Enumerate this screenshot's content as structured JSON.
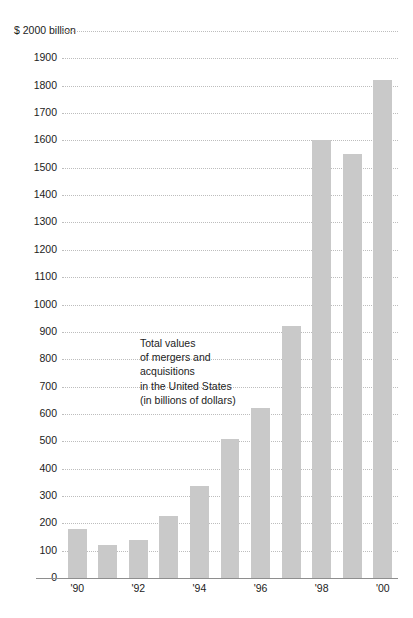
{
  "chart_data": {
    "type": "bar",
    "title": "",
    "subtitle": "",
    "xlabel": "",
    "ylabel": "",
    "y_axis_top_label": "$ 2000 billion",
    "categories": [
      "'90",
      "'91",
      "'92",
      "'93",
      "'94",
      "'95",
      "'96",
      "'97",
      "'98",
      "'99",
      "'00"
    ],
    "values": [
      180,
      120,
      140,
      225,
      335,
      510,
      620,
      920,
      1600,
      1550,
      1820
    ],
    "ylim": [
      0,
      2000
    ],
    "y_tick_step": 100,
    "y_ticks": [
      0,
      100,
      200,
      300,
      400,
      500,
      600,
      700,
      800,
      900,
      1000,
      1100,
      1200,
      1300,
      1400,
      1500,
      1600,
      1700,
      1800,
      1900,
      2000
    ],
    "y_tick_labels": [
      "0",
      "100",
      "200",
      "300",
      "400",
      "500",
      "600",
      "700",
      "800",
      "900",
      "1000",
      "1100",
      "1200",
      "1300",
      "1400",
      "1500",
      "1600",
      "1700",
      "1800",
      "1900",
      "$ 2000 billion"
    ],
    "x_tick_labels_shown": [
      "'90",
      "'92",
      "'94",
      "'96",
      "'98",
      "'00"
    ],
    "x_tick_label_indices": [
      0,
      2,
      4,
      6,
      8,
      10
    ],
    "grid": true,
    "grid_style": "dotted",
    "legend": "none",
    "annotations": [
      {
        "lines": [
          "Total values",
          "of mergers and",
          "acquisitions",
          "in the United States",
          "(in billions of dollars)"
        ]
      }
    ],
    "colors": {
      "bar": "#c9c9c9",
      "gridline": "#bdbdbd",
      "axis_line": "#8e8e8e",
      "text": "#1c1c1c",
      "background": "#ffffff"
    }
  }
}
